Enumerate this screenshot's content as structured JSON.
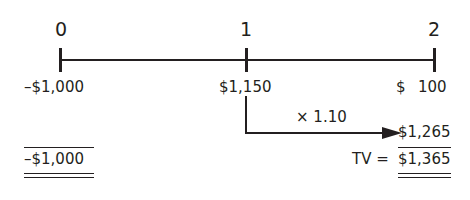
{
  "timeline": {
    "periods": [
      {
        "label": "0"
      },
      {
        "label": "1"
      },
      {
        "label": "2"
      }
    ],
    "cash_flows": [
      {
        "period": "0",
        "value": "–$1,000"
      },
      {
        "period": "1",
        "value": "$1,150"
      },
      {
        "period": "2",
        "value_symbol": "$",
        "value_amount": "100"
      }
    ]
  },
  "compounding": {
    "factor_label": "× 1.10",
    "result": "$1,265"
  },
  "totals": {
    "left_total": "–$1,000",
    "tv_label": "TV =",
    "tv_value": "$1,365"
  },
  "colors": {
    "ink": "#231f20",
    "background": "#ffffff"
  }
}
